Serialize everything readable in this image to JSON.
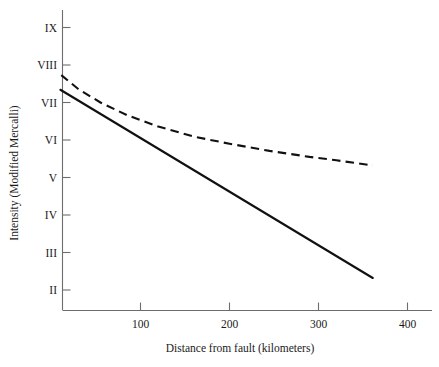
{
  "chart_data": {
    "type": "line",
    "title": "",
    "xlabel": "Distance from fault (kilometers)",
    "ylabel": "Intensity (Modified Mercalli)",
    "xlim": [
      0,
      450
    ],
    "ylim": [
      1.5,
      9.5
    ],
    "grid": false,
    "legend": "none",
    "xticks": [
      100,
      200,
      300,
      400
    ],
    "xticklabels": [
      "100",
      "200",
      "300",
      "400"
    ],
    "yticks": [
      2,
      3,
      4,
      5,
      6,
      7,
      8,
      9
    ],
    "yticklabels": [
      "II",
      "III",
      "IV",
      "V",
      "VI",
      "VII",
      "VIII",
      "IX"
    ],
    "series": [
      {
        "name": "soft-ground-attenuation",
        "style": "dashed",
        "color": "#111111",
        "x": [
          11,
          30,
          55,
          85,
          120,
          160,
          200,
          245,
          290,
          320,
          361
        ],
        "y": [
          7.73,
          7.36,
          7.0,
          6.66,
          6.36,
          6.09,
          5.9,
          5.71,
          5.55,
          5.46,
          5.32
        ]
      },
      {
        "name": "firm-ground-attenuation",
        "style": "solid",
        "color": "#111111",
        "x": [
          10,
          361
        ],
        "y": [
          7.34,
          2.32
        ]
      }
    ]
  },
  "axes": {
    "y_axis_label": "Intensity (Modified Mercalli)",
    "x_axis_label": "Distance from fault (kilometers)",
    "y_tick_labels": [
      "IX",
      "VIII",
      "VII",
      "VI",
      "V",
      "IV",
      "III",
      "II"
    ],
    "x_tick_labels": [
      "100",
      "200",
      "300",
      "400"
    ]
  }
}
